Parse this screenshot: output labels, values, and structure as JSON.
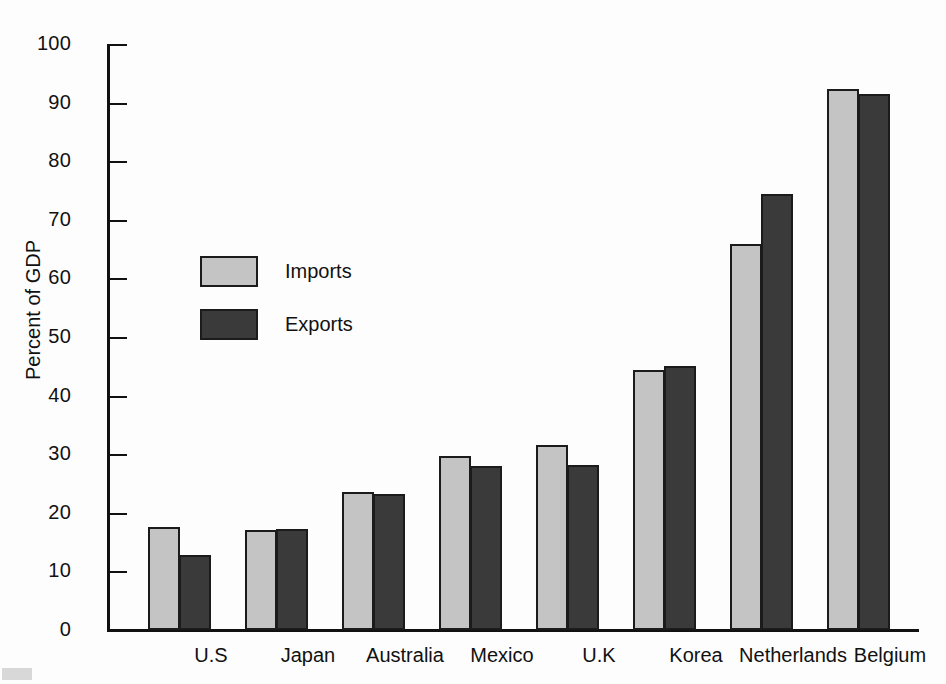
{
  "chart_data": {
    "type": "bar",
    "title": "",
    "xlabel": "",
    "ylabel": "Percent of GDP",
    "ylim": [
      0,
      100
    ],
    "yticks": [
      0,
      10,
      20,
      30,
      40,
      50,
      60,
      70,
      80,
      90,
      100
    ],
    "grid": false,
    "legend_position": "inside-upper-left",
    "categories": [
      "U.S",
      "Japan",
      "Australia",
      "Mexico",
      "U.K",
      "Korea",
      "Netherlands",
      "Belgium"
    ],
    "series": [
      {
        "name": "Imports",
        "color": "#c4c4c4",
        "values": [
          17.6,
          17.1,
          23.6,
          29.7,
          31.5,
          44.4,
          65.8,
          92.3
        ]
      },
      {
        "name": "Exports",
        "color": "#3a3a3a",
        "values": [
          12.8,
          17.3,
          23.2,
          28.0,
          28.2,
          45.1,
          74.4,
          91.4
        ]
      }
    ]
  },
  "legend": {
    "items": [
      {
        "label": "Imports",
        "swatch": "imports"
      },
      {
        "label": "Exports",
        "swatch": "exports"
      }
    ]
  },
  "axis": {
    "y_title": "Percent of GDP"
  },
  "colors": {
    "imports": "#c4c4c4",
    "exports": "#3a3a3a",
    "axis": "#111111",
    "bar_outline": "#1b1b1b",
    "background": "#fdfdfd"
  }
}
